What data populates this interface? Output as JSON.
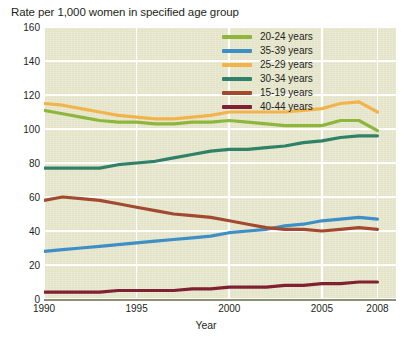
{
  "chart_data": {
    "type": "line",
    "title": "Rate per 1,000 women in specified age group",
    "xlabel": "Year",
    "ylabel": "",
    "xlim": [
      1990,
      2009
    ],
    "ylim": [
      0,
      160
    ],
    "xticks": [
      1990,
      1995,
      2000,
      2005,
      2008
    ],
    "xtick_labels": [
      "1990",
      "1995",
      "2000",
      "2005",
      "2008"
    ],
    "yticks": [
      0,
      20,
      40,
      60,
      80,
      100,
      120,
      140,
      160
    ],
    "ytick_labels": [
      "0",
      "20",
      "40",
      "60",
      "80",
      "100",
      "120",
      "140",
      "160"
    ],
    "grid": true,
    "grid_color": "#ffffff",
    "plot_background": "#e9e9cf",
    "legend_position": "top-right",
    "x": [
      1990,
      1991,
      1992,
      1993,
      1994,
      1995,
      1996,
      1997,
      1998,
      1999,
      2000,
      2001,
      2002,
      2003,
      2004,
      2005,
      2006,
      2007,
      2008
    ],
    "series": [
      {
        "name": "20-24 years",
        "color": "#8fb63c",
        "values": [
          111,
          109,
          107,
          105,
          104,
          104,
          103,
          103,
          104,
          104,
          105,
          104,
          103,
          102,
          102,
          102,
          105,
          105,
          99
        ]
      },
      {
        "name": "35-39 years",
        "color": "#3d8fc6",
        "values": [
          28,
          29,
          30,
          31,
          32,
          33,
          34,
          35,
          36,
          37,
          39,
          40,
          41,
          43,
          44,
          46,
          47,
          48,
          47
        ]
      },
      {
        "name": "25-29 years",
        "color": "#f2b44a",
        "values": [
          115,
          114,
          112,
          110,
          108,
          107,
          106,
          106,
          107,
          108,
          110,
          110,
          110,
          110,
          111,
          112,
          115,
          116,
          110
        ]
      },
      {
        "name": "30-34 years",
        "color": "#2f8168",
        "values": [
          77,
          77,
          77,
          77,
          79,
          80,
          81,
          83,
          85,
          87,
          88,
          88,
          89,
          90,
          92,
          93,
          95,
          96,
          96
        ]
      },
      {
        "name": "15-19 years",
        "color": "#a24a2f",
        "values": [
          58,
          60,
          59,
          58,
          56,
          54,
          52,
          50,
          49,
          48,
          46,
          44,
          42,
          41,
          41,
          40,
          41,
          42,
          41
        ]
      },
      {
        "name": "40-44 years",
        "color": "#7f2033",
        "values": [
          4,
          4,
          4,
          4,
          5,
          5,
          5,
          5,
          6,
          6,
          7,
          7,
          7,
          8,
          8,
          9,
          9,
          10,
          10
        ]
      }
    ]
  },
  "legend": {
    "items": [
      {
        "label": "20-24 years"
      },
      {
        "label": "35-39 years"
      },
      {
        "label": "25-29 years"
      },
      {
        "label": "30-34 years"
      },
      {
        "label": "15-19 years"
      },
      {
        "label": "40-44 years"
      }
    ]
  }
}
